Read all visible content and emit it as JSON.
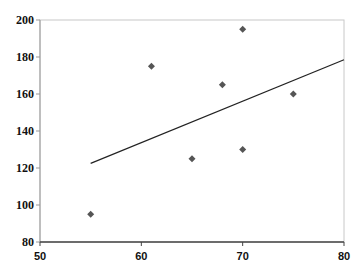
{
  "chart_data": {
    "type": "scatter",
    "title": "",
    "xlabel": "",
    "ylabel": "",
    "xlim": [
      50,
      80
    ],
    "ylim": [
      80,
      200
    ],
    "x_ticks": [
      50,
      60,
      70,
      80
    ],
    "y_ticks": [
      80,
      100,
      120,
      140,
      160,
      180,
      200
    ],
    "grid": false,
    "legend": null,
    "series": [
      {
        "name": "data",
        "marker": "diamond",
        "color": "#555555",
        "points": [
          {
            "x": 55,
            "y": 95
          },
          {
            "x": 61,
            "y": 175
          },
          {
            "x": 65,
            "y": 125
          },
          {
            "x": 68,
            "y": 165
          },
          {
            "x": 70,
            "y": 195
          },
          {
            "x": 70,
            "y": 130
          },
          {
            "x": 75,
            "y": 160
          }
        ]
      }
    ],
    "trendline": {
      "type": "linear",
      "color": "#222222",
      "from": {
        "x": 55,
        "y": 122.5
      },
      "to": {
        "x": 80,
        "y": 178.5
      }
    }
  }
}
